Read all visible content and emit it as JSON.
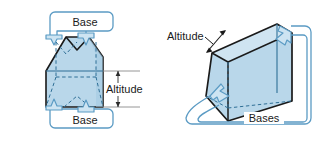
{
  "figure": {
    "labels": {
      "base_top_left": "Base",
      "base_bottom_left": "Base",
      "altitude_left": "Altitude",
      "altitude_right": "Altitude",
      "bases_right": "Bases"
    },
    "colors": {
      "solid_fill": "#b9d7ea",
      "solid_fill_light": "#cde4f2",
      "solid_fill_dark": "#a3c8e0",
      "solid_outline": "#1a1a1a",
      "hidden_edge": "#2f6f96",
      "callout_stroke": "#5b9bc4",
      "callout_fill": "#ffffff",
      "dimension_line": "#6b6b6b",
      "text": "#1a1a1a",
      "background": "#ffffff"
    },
    "left_figure": {
      "name": "trapezoidal-prism-front-view",
      "description": "Trapezoidal prism seen nearly face-on with dashed hidden edges, Base callouts arrowing into top and bottom faces, Altitude dimension at right"
    },
    "right_figure": {
      "name": "triangular-prism-3d-view",
      "description": "Triangular prism drawn in oblique 3D with dashed hidden edges, Bases callout arrowing into left and right triangular faces, Altitude double arrow at upper left"
    }
  }
}
